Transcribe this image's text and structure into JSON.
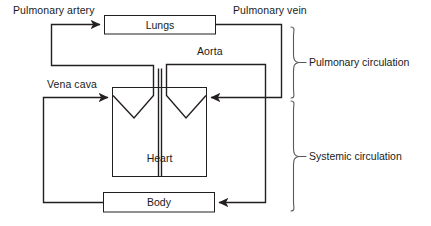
{
  "diagram": {
    "stroke_color": "#231f20",
    "text_color": "#1a1a1a",
    "background_color": "#ffffff",
    "nodes": [
      {
        "id": "lungs",
        "label": "Lungs",
        "x": 104,
        "y": 15,
        "w": 112,
        "h": 19
      },
      {
        "id": "heart",
        "label": "Heart",
        "x": 112,
        "y": 87,
        "w": 95,
        "h": 90
      },
      {
        "id": "body",
        "label": "Body",
        "x": 103,
        "y": 192,
        "w": 112,
        "h": 20
      }
    ],
    "vessel_labels": [
      {
        "id": "pulmonary-artery",
        "label": "Pulmonary artery",
        "x": 13,
        "y": 4
      },
      {
        "id": "pulmonary-vein",
        "label": "Pulmonary vein",
        "x": 233,
        "y": 4
      },
      {
        "id": "aorta",
        "label": "Aorta",
        "x": 197,
        "y": 45
      },
      {
        "id": "vena-cava",
        "label": "Vena cava",
        "x": 47,
        "y": 78
      }
    ],
    "braces": [
      {
        "id": "pulmonary-circulation",
        "label": "Pulmonary circulation",
        "top": 27,
        "bottom": 98,
        "label_x": 323,
        "label_y": 56
      },
      {
        "id": "systemic-circulation",
        "label": "Systemic circulation",
        "top": 101,
        "bottom": 211,
        "label_x": 323,
        "label_y": 150
      }
    ]
  }
}
